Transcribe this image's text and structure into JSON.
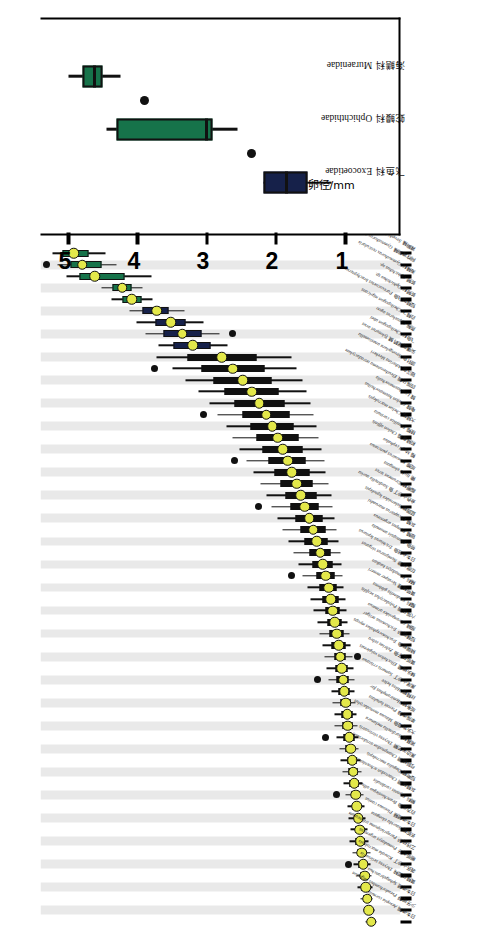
{
  "figure": {
    "axis_title": "卵径/mm",
    "axis_ticks": [
      1,
      2,
      3,
      4,
      5
    ],
    "axis_range": [
      0.2,
      5.4
    ],
    "inset_families": [
      "飞鱼科 Exocoetidae",
      "蛇鳗科 Ophichthidae",
      "海鳝科 Muraenidae"
    ]
  },
  "chart_data": {
    "type": "box",
    "title": "",
    "xlabel": "",
    "ylabel": "卵径/mm",
    "ylim": [
      0.2,
      5.4
    ],
    "yticks": [
      1,
      2,
      3,
      4,
      5
    ],
    "grid": false,
    "legend": "",
    "note": "Egg diameter (mm) box plots per fish species, ordered by increasing median. Yellow dot = median, box = IQR, whiskers = range, black dots = outliers.",
    "species": [
      {
        "cn": "日本须鳎",
        "sci": "Aesopia cornuta",
        "median": 0.62,
        "q1": 0.58,
        "q3": 0.66,
        "lo": 0.54,
        "hi": 0.7,
        "out": [],
        "color": "dark"
      },
      {
        "cn": "少牙斑鲆",
        "sci": "Pseudorhombus oligodon",
        "median": 0.66,
        "q1": 0.62,
        "q3": 0.7,
        "lo": 0.58,
        "hi": 0.74,
        "out": [],
        "color": "dark"
      },
      {
        "cn": "日本须鳗",
        "sci": "Sphagebranchus",
        "median": 0.68,
        "q1": 0.64,
        "q3": 0.73,
        "lo": 0.6,
        "hi": 0.78,
        "out": [],
        "color": "dark"
      },
      {
        "cn": "黄鳍马面鲀",
        "sci": "Thryssa setirostris",
        "median": 0.7,
        "q1": 0.65,
        "q3": 0.76,
        "lo": 0.6,
        "hi": 0.82,
        "out": [],
        "color": "dark"
      },
      {
        "cn": "裘氏小沙丁",
        "sci": "Kowala macrolepis",
        "median": 0.72,
        "q1": 0.67,
        "q3": 0.78,
        "lo": 0.62,
        "hi": 0.84,
        "out": [],
        "color": "dark"
      },
      {
        "cn": "眼斑丸牙",
        "sci": "Pomadasys argenteus",
        "median": 0.74,
        "q1": 0.69,
        "q3": 0.8,
        "lo": 0.63,
        "hi": 0.88,
        "out": [
          0.95
        ],
        "color": "dark"
      },
      {
        "cn": "三线矶鲈",
        "sci": "Parapristipoma trilineatum",
        "median": 0.76,
        "q1": 0.7,
        "q3": 0.82,
        "lo": 0.64,
        "hi": 0.9,
        "out": [],
        "color": "dark"
      },
      {
        "cn": "长蛇鲻",
        "sci": "Saurida elongata",
        "median": 0.78,
        "q1": 0.72,
        "q3": 0.85,
        "lo": 0.66,
        "hi": 0.94,
        "out": [],
        "color": "dark"
      },
      {
        "cn": "日本须鳗鲡",
        "sci": "Plotosus canius",
        "median": 0.79,
        "q1": 0.74,
        "q3": 0.85,
        "lo": 0.68,
        "hi": 0.92,
        "out": [],
        "color": "dark"
      },
      {
        "cn": "白方头鱼",
        "sci": "Branchiostegus albus",
        "median": 0.81,
        "q1": 0.76,
        "q3": 0.87,
        "lo": 0.7,
        "hi": 0.95,
        "out": [],
        "color": "dark"
      },
      {
        "cn": "鲷科",
        "sci": "Evynnis cardinalis",
        "median": 0.83,
        "q1": 0.78,
        "q3": 0.89,
        "lo": 0.72,
        "hi": 0.97,
        "out": [],
        "color": "dark"
      },
      {
        "cn": "灰鳍棘鲷",
        "sci": "Chaetodon schoenleinii",
        "median": 0.85,
        "q1": 0.79,
        "q3": 0.91,
        "lo": 0.73,
        "hi": 1.0,
        "out": [
          1.12
        ],
        "color": "dark"
      },
      {
        "cn": "短吻鲾",
        "sci": "Dagulia macrolepis",
        "median": 0.87,
        "q1": 0.81,
        "q3": 0.93,
        "lo": 0.75,
        "hi": 1.02,
        "out": [],
        "color": "dark"
      },
      {
        "cn": "弓斜鳞鲷",
        "sci": "Champsodon atridorsalis",
        "median": 0.88,
        "q1": 0.82,
        "q3": 0.95,
        "lo": 0.76,
        "hi": 1.04,
        "out": [],
        "color": "dark"
      },
      {
        "cn": "黑边天竺鲷",
        "sci": "Thryssa vitrirostris",
        "median": 0.9,
        "q1": 0.84,
        "q3": 0.97,
        "lo": 0.78,
        "hi": 1.06,
        "out": [],
        "color": "dark"
      },
      {
        "cn": "褐菖鲉",
        "sci": "Sardinella melanura",
        "median": 0.92,
        "q1": 0.86,
        "q3": 0.99,
        "lo": 0.8,
        "hi": 1.08,
        "out": [],
        "color": "dark"
      },
      {
        "cn": "大头狗母鱼",
        "sci": "Minous monodactylus",
        "median": 0.94,
        "q1": 0.87,
        "q3": 1.02,
        "lo": 0.8,
        "hi": 1.12,
        "out": [
          1.28
        ],
        "color": "dark"
      },
      {
        "cn": "单指虎鲉",
        "sci": "Pterois lunulata",
        "median": 0.96,
        "q1": 0.89,
        "q3": 1.04,
        "lo": 0.82,
        "hi": 1.15,
        "out": [],
        "color": "dark"
      },
      {
        "cn": "斑条鳗",
        "sci": "Hemiramphus far",
        "median": 0.97,
        "q1": 0.9,
        "q3": 1.05,
        "lo": 0.83,
        "hi": 1.16,
        "out": [],
        "color": "dark"
      },
      {
        "cn": "丝鳍鲻",
        "sci": "Hilsa kelee",
        "median": 0.99,
        "q1": 0.92,
        "q3": 1.07,
        "lo": 0.85,
        "hi": 1.18,
        "out": [],
        "color": "dark"
      },
      {
        "cn": "黑尾小沙丁",
        "sci": "Samaris cristatus",
        "median": 1.01,
        "q1": 0.93,
        "q3": 1.09,
        "lo": 0.86,
        "hi": 1.2,
        "out": [],
        "color": "dark"
      },
      {
        "cn": "棘头梅童",
        "sci": "Ellochelon vaigiensis",
        "median": 1.03,
        "q1": 0.95,
        "q3": 1.12,
        "lo": 0.87,
        "hi": 1.24,
        "out": [
          1.4
        ],
        "color": "dark"
      },
      {
        "cn": "黄斑蓝子鱼",
        "sci": "Zebrias zebra",
        "median": 1.05,
        "q1": 0.97,
        "q3": 1.14,
        "lo": 0.88,
        "hi": 1.27,
        "out": [],
        "color": "dark"
      },
      {
        "cn": "鳞烟管鱼",
        "sci": "Trachinocephalus myops",
        "median": 1.07,
        "q1": 0.99,
        "q3": 1.16,
        "lo": 0.9,
        "hi": 1.3,
        "out": [
          0.82
        ],
        "color": "dark"
      },
      {
        "cn": "短棘银鲈",
        "sci": "Trichonotus setiger",
        "median": 1.09,
        "q1": 1.0,
        "q3": 1.19,
        "lo": 0.92,
        "hi": 1.33,
        "out": [],
        "color": "dark"
      },
      {
        "cn": "细鳞",
        "sci": "Carangoides armatus",
        "median": 1.12,
        "q1": 1.03,
        "q3": 1.22,
        "lo": 0.94,
        "hi": 1.37,
        "out": [],
        "color": "dark"
      },
      {
        "cn": "六指马鲅",
        "sci": "Polydactylus sexfilis",
        "median": 1.15,
        "q1": 1.05,
        "q3": 1.25,
        "lo": 0.96,
        "hi": 1.4,
        "out": [],
        "color": "dark"
      },
      {
        "cn": "鲾科",
        "sci": "Sardinella gibbosa",
        "median": 1.18,
        "q1": 1.08,
        "q3": 1.29,
        "lo": 0.98,
        "hi": 1.45,
        "out": [],
        "color": "dark"
      },
      {
        "cn": "黄带鲱鲤",
        "sci": "Verasper moseri",
        "median": 1.21,
        "q1": 1.1,
        "q3": 1.33,
        "lo": 1.0,
        "hi": 1.5,
        "out": [],
        "color": "dark"
      },
      {
        "cn": "鲬科",
        "sci": "Pomadasys kaakan",
        "median": 1.24,
        "q1": 1.12,
        "q3": 1.37,
        "lo": 1.02,
        "hi": 1.55,
        "out": [],
        "color": "dark"
      },
      {
        "cn": "印度丝鲹",
        "sci": "Nemipterus virgatus",
        "median": 1.28,
        "q1": 1.15,
        "q3": 1.42,
        "lo": 1.04,
        "hi": 1.62,
        "out": [
          1.78
        ],
        "color": "dark"
      },
      {
        "cn": "日本金线鱼",
        "sci": "Trichiurus lepturus",
        "median": 1.32,
        "q1": 1.18,
        "q3": 1.47,
        "lo": 1.05,
        "hi": 1.68,
        "out": [],
        "color": "dark"
      },
      {
        "cn": "带鱼",
        "sci": "Psenopsis anomala",
        "median": 1.36,
        "q1": 1.21,
        "q3": 1.52,
        "lo": 1.07,
        "hi": 1.74,
        "out": [],
        "color": "dark"
      },
      {
        "cn": "银鲳",
        "sci": "Pampus argenteus",
        "median": 1.41,
        "q1": 1.25,
        "q3": 1.58,
        "lo": 1.1,
        "hi": 1.82,
        "out": [],
        "color": "dark"
      },
      {
        "cn": "灰鲳",
        "sci": "Decapterus maruadsi",
        "median": 1.46,
        "q1": 1.29,
        "q3": 1.64,
        "lo": 1.12,
        "hi": 1.9,
        "out": [],
        "color": "dark"
      },
      {
        "cn": "蓝圆鲹",
        "sci": "Selaroides leptolepis",
        "median": 1.52,
        "q1": 1.33,
        "q3": 1.72,
        "lo": 1.15,
        "hi": 1.98,
        "out": [],
        "color": "dark"
      },
      {
        "cn": "金色小沙丁鱼",
        "sci": "Sardinella aurita",
        "median": 1.58,
        "q1": 1.38,
        "q3": 1.79,
        "lo": 1.18,
        "hi": 2.06,
        "out": [
          2.25
        ],
        "color": "dark"
      },
      {
        "cn": "脂眼鲱",
        "sci": "Etrumeus teres",
        "median": 1.64,
        "q1": 1.42,
        "q3": 1.86,
        "lo": 1.2,
        "hi": 2.14,
        "out": [],
        "color": "dark"
      },
      {
        "cn": "鳓",
        "sci": "Ilisha elongata",
        "median": 1.7,
        "q1": 1.47,
        "q3": 1.94,
        "lo": 1.24,
        "hi": 2.22,
        "out": [],
        "color": "dark"
      },
      {
        "cn": "斑鰶",
        "sci": "Konosirus punctatus",
        "median": 1.77,
        "q1": 1.52,
        "q3": 2.02,
        "lo": 1.28,
        "hi": 2.32,
        "out": [],
        "color": "dark"
      },
      {
        "cn": "鲻",
        "sci": "Mugil cephalus",
        "median": 1.83,
        "q1": 1.57,
        "q3": 2.1,
        "lo": 1.3,
        "hi": 2.42,
        "out": [
          2.6
        ],
        "color": "dark"
      },
      {
        "cn": "前鳞骨鲻",
        "sci": "Chelon affinis",
        "median": 1.9,
        "q1": 1.62,
        "q3": 2.19,
        "lo": 1.34,
        "hi": 2.52,
        "out": [],
        "color": "dark"
      },
      {
        "cn": "棱鲻",
        "sci": "Planiliza carinata",
        "median": 1.97,
        "q1": 1.68,
        "q3": 2.28,
        "lo": 1.38,
        "hi": 2.62,
        "out": [],
        "color": "dark"
      },
      {
        "cn": "大鳞鲻",
        "sci": "Chelon macrolepis",
        "median": 2.05,
        "q1": 1.74,
        "q3": 2.37,
        "lo": 1.42,
        "hi": 2.72,
        "out": [],
        "color": "dark"
      },
      {
        "cn": "龟鮻",
        "sci": "Chelon haematocheilus",
        "median": 2.14,
        "q1": 1.8,
        "q3": 2.48,
        "lo": 1.46,
        "hi": 2.84,
        "out": [
          3.05
        ],
        "color": "dark"
      },
      {
        "cn": "鮻",
        "sci": "Liza haematocheila",
        "median": 2.24,
        "q1": 1.88,
        "q3": 2.6,
        "lo": 1.5,
        "hi": 2.96,
        "out": [],
        "color": "dark"
      },
      {
        "cn": "四指马鲅",
        "sci": "Eleutheronema tetradactylum",
        "median": 2.35,
        "q1": 1.96,
        "q3": 2.74,
        "lo": 1.56,
        "hi": 3.12,
        "out": [],
        "color": "dark"
      },
      {
        "cn": "银汉鱼",
        "sci": "Atherina bleekeri",
        "median": 2.48,
        "q1": 2.06,
        "q3": 2.9,
        "lo": 1.62,
        "hi": 3.3,
        "out": [],
        "color": "dark"
      },
      {
        "cn": "颌针鱼",
        "sci": "Strongylura anastomella",
        "median": 2.62,
        "q1": 2.16,
        "q3": 3.08,
        "lo": 1.7,
        "hi": 3.5,
        "out": [
          3.75
        ],
        "color": "dark"
      },
      {
        "cn": "尖嘴圆尾鹤鱵",
        "sci": "Tylosurus acus",
        "median": 2.78,
        "q1": 2.28,
        "q3": 3.28,
        "lo": 1.78,
        "hi": 3.72,
        "out": [],
        "color": "dark"
      },
      {
        "cn": "飞鱼科",
        "sci": "Cheilopogon abei",
        "median": 3.2,
        "q1": 2.95,
        "q3": 3.48,
        "lo": 2.7,
        "hi": 3.7,
        "out": [],
        "color": "navy"
      },
      {
        "cn": "燕鳐",
        "sci": "Cypselurus agoo",
        "median": 3.35,
        "q1": 3.08,
        "q3": 3.62,
        "lo": 2.82,
        "hi": 3.88,
        "out": [
          2.62
        ],
        "color": "navy"
      },
      {
        "cn": "白鳍飞",
        "sci": "Cheilopogon nigricans",
        "median": 3.52,
        "q1": 3.3,
        "q3": 3.74,
        "lo": 3.05,
        "hi": 4.02,
        "out": [],
        "color": "navy"
      },
      {
        "cn": "短鳍拟飞鱼",
        "sci": "Parexocoetus brachypterus",
        "median": 3.72,
        "q1": 3.55,
        "q3": 3.92,
        "lo": 3.32,
        "hi": 4.12,
        "out": [],
        "color": "navy"
      },
      {
        "cn": "蛇鳗科",
        "sci": "Ophichthus sp.",
        "median": 4.08,
        "q1": 3.94,
        "q3": 4.22,
        "lo": 3.78,
        "hi": 4.38,
        "out": [],
        "color": "green"
      },
      {
        "cn": "蛇鳗",
        "sci": "Ophichthus sp.",
        "median": 4.22,
        "q1": 4.08,
        "q3": 4.36,
        "lo": 3.92,
        "hi": 4.52,
        "out": [],
        "color": "green"
      },
      {
        "cn": "海鳝科",
        "sci": "Gymnothorax reticularis",
        "median": 4.62,
        "q1": 4.18,
        "q3": 4.84,
        "lo": 3.8,
        "hi": 5.02,
        "out": [],
        "color": "green"
      },
      {
        "cn": "网纹裸胸鳝",
        "sci": "Gymnothorax kidako",
        "median": 4.8,
        "q1": 4.52,
        "q3": 4.96,
        "lo": 4.3,
        "hi": 5.15,
        "out": [
          5.32
        ],
        "color": "green"
      },
      {
        "cn": "裸胸鳝",
        "sci": "Strophidion sathete",
        "median": 4.92,
        "q1": 4.7,
        "q3": 5.08,
        "lo": 4.46,
        "hi": 5.22,
        "out": [],
        "color": "green"
      }
    ]
  },
  "inset_data": {
    "type": "box",
    "ylim": [
      0.2,
      5.4
    ],
    "yticks": [
      1,
      2,
      3,
      4,
      5
    ],
    "ylabel": "卵径/mm",
    "boxes": [
      {
        "family": "飞鱼科 Exocoetidae",
        "median": 1.85,
        "q1": 1.55,
        "q3": 2.18,
        "lo": 1.2,
        "hi": 2.18,
        "out": [
          2.35
        ],
        "color": "navy"
      },
      {
        "family": "蛇鳗科 Ophichthidae",
        "median": 3.0,
        "q1": 2.92,
        "q3": 4.3,
        "lo": 2.55,
        "hi": 4.45,
        "out": [
          3.9
        ],
        "color": "green"
      },
      {
        "family": "海鳝科 Muraenidae",
        "median": 4.62,
        "q1": 4.5,
        "q3": 4.8,
        "lo": 4.25,
        "hi": 5.0,
        "out": [],
        "color": "green"
      }
    ]
  }
}
